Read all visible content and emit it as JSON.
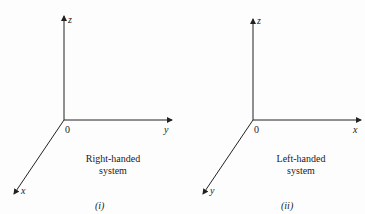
{
  "figure": {
    "left": {
      "axis_z": "z",
      "axis_y": "y",
      "axis_x": "x",
      "origin": "0",
      "caption_line1": "Right-handed",
      "caption_line2": "system",
      "sublabel": "(i)"
    },
    "right": {
      "axis_z": "z",
      "axis_x": "x",
      "axis_y": "y",
      "origin": "0",
      "caption_line1": "Left-handed",
      "caption_line2": "system",
      "sublabel": "(ii)"
    },
    "line_color": "#222222"
  }
}
